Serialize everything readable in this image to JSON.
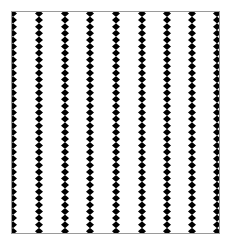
{
  "image": {
    "width": 228,
    "height": 243,
    "background": "#ffffff"
  },
  "frame": {
    "x": 11,
    "y": 11,
    "width": 209,
    "height": 223,
    "stroke": "#9a9a9a",
    "stroke_width": 1
  },
  "pattern": {
    "shape": "diamond",
    "fill": "#000000",
    "column_centers_x": [
      13,
      39,
      65,
      90,
      116,
      142,
      167,
      192,
      217
    ],
    "diamond_width": 8,
    "diamond_height": 7,
    "vertical_pitch": 6.6,
    "first_center_y": 13.5,
    "clip_to_frame": true
  }
}
